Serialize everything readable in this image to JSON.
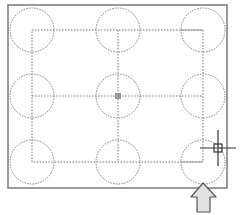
{
  "colors": {
    "background": "#ffffff",
    "border": "#7a7a7a",
    "circle_stroke": "#7f7f7f",
    "centerline": "#777777",
    "crosshair": "#333333",
    "center_marker": "#9a9a9a",
    "arrow_fill": "#e2e2e2",
    "arrow_stroke": "#555555"
  },
  "drawing": {
    "outer_border": {
      "x": 8,
      "y": 5,
      "width": 219,
      "height": 183
    },
    "inner_rect": {
      "x": 32,
      "y": 30,
      "width": 171,
      "height": 132
    },
    "circle_radius": 22,
    "columns_x": [
      32,
      118,
      203
    ],
    "rows_y": [
      30,
      96,
      162
    ],
    "center_marker": {
      "x": 118,
      "y": 96,
      "size": 6
    }
  },
  "cursor": {
    "type": "crosshair",
    "x": 218,
    "y": 148,
    "arm_length": 18,
    "pickbox_size": 8
  },
  "indicator_arrow": {
    "direction": "up",
    "tip": {
      "x": 203,
      "y": 183
    }
  }
}
